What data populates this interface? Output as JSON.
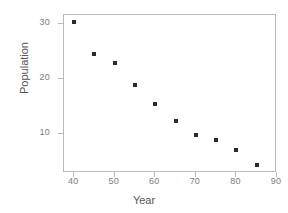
{
  "chart_data": {
    "type": "scatter",
    "title": "",
    "xlabel": "Year",
    "ylabel": "Population",
    "xlim": [
      37.5,
      90
    ],
    "ylim": [
      3.0,
      31.6
    ],
    "grid": false,
    "legend": null,
    "xticks": [
      40,
      50,
      60,
      70,
      80,
      90
    ],
    "xtick_labels": [
      "40",
      "50",
      "60",
      "70",
      "80",
      "90"
    ],
    "yticks": [
      10,
      20,
      30
    ],
    "ytick_labels": [
      "10",
      "20",
      "30"
    ],
    "marker": "square",
    "marker_color": "#2b2b2b",
    "frame_color": "#b9b9b9",
    "tick_label_color": "#7d7d7d",
    "axis_label_color": "#555555",
    "x": [
      40,
      45,
      50,
      55,
      60,
      65,
      70,
      75,
      80,
      85
    ],
    "y": [
      30.3,
      24.5,
      23.0,
      19.0,
      15.5,
      12.4,
      9.8,
      9.0,
      7.2,
      4.5
    ],
    "points": [
      {
        "x": 40,
        "y": 30.3
      },
      {
        "x": 45,
        "y": 24.5
      },
      {
        "x": 50,
        "y": 23.0
      },
      {
        "x": 55,
        "y": 19.0
      },
      {
        "x": 60,
        "y": 15.5
      },
      {
        "x": 65,
        "y": 12.4
      },
      {
        "x": 70,
        "y": 9.8
      },
      {
        "x": 75,
        "y": 9.0
      },
      {
        "x": 80,
        "y": 7.2
      },
      {
        "x": 85,
        "y": 4.5
      }
    ]
  }
}
